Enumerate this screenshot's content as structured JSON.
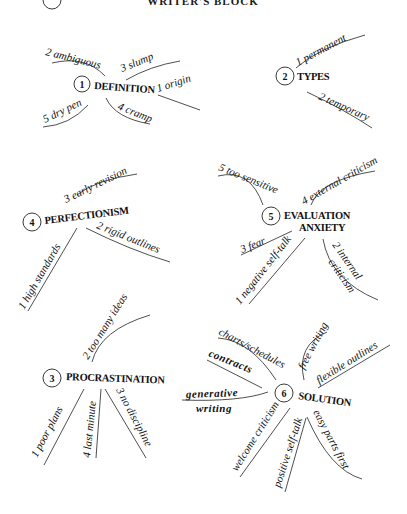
{
  "title": "WRITER'S BLOCK",
  "nodes": [
    {
      "id": 1,
      "label": "DEFINITION",
      "branches": [
        "1 origin",
        "2 ambiguous",
        "3 slump",
        "4 cramp",
        "5 dry pen"
      ]
    },
    {
      "id": 2,
      "label": "TYPES",
      "branches": [
        "1 permanent",
        "2 temporary"
      ]
    },
    {
      "id": 4,
      "label": "PERFECTIONISM",
      "branches": [
        "1 high standards",
        "2 rigid outlines",
        "3 early revision"
      ]
    },
    {
      "id": 5,
      "label_line1": "EVALUATION",
      "label_line2": "ANXIETY",
      "branches": [
        "1 negative self-talk",
        "2 internal",
        "criticism",
        "3 fear",
        "4 external criticism",
        "5 too sensitive"
      ]
    },
    {
      "id": 3,
      "label": "PROCRASTINATION",
      "branches": [
        "1 poor plans",
        "2 too many ideas",
        "3 no discipline",
        "4 last minute"
      ]
    },
    {
      "id": 6,
      "label": "SOLUTION",
      "branches": [
        "charts/schedules",
        "free writing",
        "flexible outlines",
        "contracts",
        "generative",
        "writing",
        "welcome criticism",
        "positive self-talk",
        "easy parts first"
      ]
    }
  ]
}
